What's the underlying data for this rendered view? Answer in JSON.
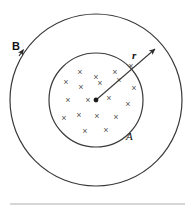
{
  "figure": {
    "type": "physics-diagram",
    "background_color": "#ffffff",
    "stroke_color": "#3a3a3a",
    "mark_color": "#555555",
    "rule_color": "#c8c8c8",
    "outer_circle": {
      "name": "outer-circle",
      "cx": 96,
      "cy": 100,
      "r": 86,
      "stroke_width": 1.2
    },
    "inner_circle": {
      "name": "inner-circle",
      "cx": 96,
      "cy": 100,
      "r": 47,
      "stroke_width": 1.2
    },
    "center_dot": {
      "name": "center-dot",
      "cx": 96,
      "cy": 100,
      "r": 2.4
    },
    "radius_arrow": {
      "name": "radius-arrow",
      "x1": 96,
      "y1": 100,
      "x2": 157,
      "y2": 48
    },
    "field_marks": {
      "symbol": "×",
      "count": 19,
      "positions": [
        [
          80,
          72
        ],
        [
          96,
          77
        ],
        [
          115,
          72
        ],
        [
          66,
          82
        ],
        [
          81,
          87
        ],
        [
          100,
          83
        ],
        [
          119,
          80
        ],
        [
          134,
          88
        ],
        [
          68,
          100
        ],
        [
          88,
          100
        ],
        [
          109,
          98
        ],
        [
          128,
          104
        ],
        [
          64,
          118
        ],
        [
          79,
          115
        ],
        [
          97,
          116
        ],
        [
          116,
          117
        ],
        [
          85,
          131
        ],
        [
          106,
          130
        ],
        [
          131,
          66
        ]
      ]
    },
    "labels": {
      "field_label": "B",
      "radius_label": "r",
      "area_label": "A"
    },
    "bottom_rule": {
      "name": "bottom-rule",
      "x1": 10,
      "x2": 185,
      "y": 204
    }
  }
}
